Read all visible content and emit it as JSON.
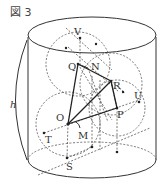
{
  "figure": {
    "title": "図 3",
    "height_label": "h",
    "points": {
      "V": "V",
      "Q": "Q",
      "N": "N",
      "R": "R",
      "U": "U",
      "P": "P",
      "O": "O",
      "M": "M",
      "T": "T",
      "S": "S"
    }
  }
}
